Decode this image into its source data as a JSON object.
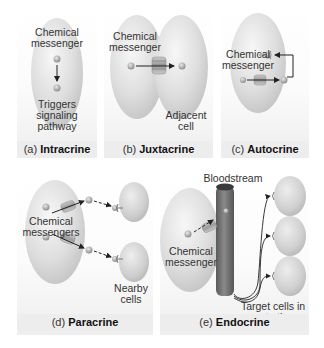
{
  "figure": {
    "panels": [
      {
        "id": "a",
        "caption_prefix": "(a)",
        "caption_title": "Intracrine",
        "labels": {
          "messenger": "Chemical messenger",
          "effect": "Triggers signaling pathway"
        }
      },
      {
        "id": "b",
        "caption_prefix": "(b)",
        "caption_title": "Juxtacrine",
        "labels": {
          "messenger": "Chemical messenger",
          "target": "Adjacent cell"
        }
      },
      {
        "id": "c",
        "caption_prefix": "(c)",
        "caption_title": "Autocrine",
        "labels": {
          "messenger": "Chemical messenger"
        }
      },
      {
        "id": "d",
        "caption_prefix": "(d)",
        "caption_title": "Paracrine",
        "labels": {
          "messenger": "Chemical messengers",
          "target": "Nearby cells"
        }
      },
      {
        "id": "e",
        "caption_prefix": "(e)",
        "caption_title": "Endocrine",
        "labels": {
          "vessel": "Bloodstream",
          "messenger": "Chemical messenger",
          "target": "Target cells in remote tissue"
        }
      }
    ],
    "colors": {
      "cell": "#d6d6d6",
      "cell_highlight": "#f4f4f4",
      "vessel": "#6f6f6f",
      "arrow": "#222222",
      "caption_bg": "#ededed"
    }
  }
}
